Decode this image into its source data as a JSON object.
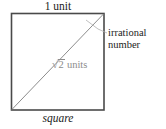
{
  "figure": {
    "name": "square-with-diagonal-irrational-number",
    "shape": "square",
    "top_label": "1 unit",
    "bottom_label": "square",
    "diagonal": {
      "radical_sign": "√",
      "radicand": "2",
      "units_text": " units",
      "full_label": "√2 units"
    },
    "annotation": {
      "line1": "irrational",
      "line2": "number"
    },
    "colors": {
      "square_stroke": "#4a4a4a",
      "diagonal_stroke": "#8c8c8c",
      "leader_stroke": "#b0b0b0",
      "text": "#1b1b1b",
      "diagonal_text": "#8c8c8c",
      "background": "#ffffff"
    },
    "geometry": {
      "square_left": 11,
      "square_top": 13,
      "square_right": 104,
      "square_bottom": 110,
      "diagonal_from": "bottom-left",
      "diagonal_to": "top-right"
    }
  }
}
